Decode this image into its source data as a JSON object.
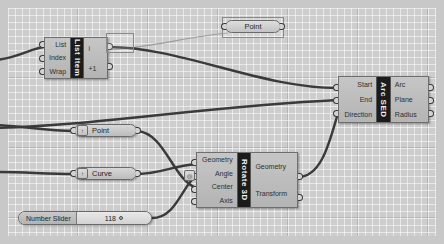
{
  "app": {
    "canvas_name": "grasshopper-canvas",
    "background_color": "#cdcdcd",
    "grid_color": "#ffffff",
    "wire_color": "#3a3a3a",
    "wire_faint_color": "#9a9a9a"
  },
  "components": {
    "list_item": {
      "title": "List Item",
      "inputs": [
        "List",
        "Index",
        "Wrap"
      ],
      "outputs": [
        "i",
        "+1"
      ]
    },
    "arc_sed": {
      "title": "Arc SED",
      "inputs": [
        "Start",
        "End",
        "Direction"
      ],
      "outputs": [
        "Arc",
        "Plane",
        "Radius"
      ]
    },
    "rotate_3d": {
      "title": "Rotate 3D",
      "inputs": [
        "Geometry",
        "Angle",
        "Center",
        "Axis"
      ],
      "outputs": [
        "Geometry",
        "Transform"
      ],
      "angle_badge": "◎"
    }
  },
  "params": {
    "point_top": {
      "label": "Point"
    },
    "point_mid": {
      "label": "Point",
      "badge": "↑"
    },
    "curve_mid": {
      "label": "Curve",
      "badge": "↑"
    }
  },
  "slider": {
    "name": "Number Slider",
    "value": "118",
    "grip": "○"
  }
}
